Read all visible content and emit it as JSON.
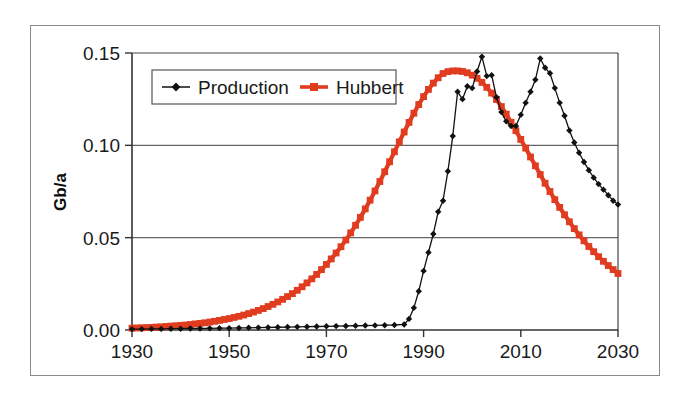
{
  "chart_data": {
    "type": "line",
    "title": "",
    "subtitle": "",
    "xlabel": "",
    "ylabel": "Gb/a",
    "xlim": [
      1930,
      2030
    ],
    "ylim": [
      0.0,
      0.15
    ],
    "xticks": [
      "1930",
      "1950",
      "1970",
      "1990",
      "2010",
      "2030"
    ],
    "xtick_values": [
      1930,
      1950,
      1970,
      1990,
      2010,
      2030
    ],
    "yticks": [
      "0.00",
      "0.05",
      "0.10",
      "0.15"
    ],
    "ytick_values": [
      0.0,
      0.05,
      0.1,
      0.15
    ],
    "grid": "horizontal",
    "legend_position": "top-left-inside",
    "colors": {
      "production": "#111111",
      "hubbert": "#e03c20",
      "axis": "#333333",
      "grid": "#666666",
      "frame": "#8a8a8a",
      "background": "#ffffff"
    },
    "series": [
      {
        "name": "Production",
        "color": "#111111",
        "marker": "diamond",
        "x": [
          1930,
          1932,
          1934,
          1936,
          1938,
          1940,
          1942,
          1944,
          1946,
          1948,
          1950,
          1952,
          1954,
          1956,
          1958,
          1960,
          1962,
          1964,
          1966,
          1968,
          1970,
          1972,
          1974,
          1976,
          1978,
          1980,
          1982,
          1984,
          1986,
          1987,
          1988,
          1989,
          1990,
          1991,
          1992,
          1993,
          1994,
          1995,
          1996,
          1997,
          1998,
          1999,
          2000,
          2001,
          2002,
          2003,
          2004,
          2005,
          2006,
          2007,
          2008,
          2009,
          2010,
          2011,
          2012,
          2013,
          2014,
          2015,
          2016,
          2017,
          2018,
          2019,
          2020,
          2021,
          2022,
          2023,
          2024,
          2025,
          2026,
          2027,
          2028,
          2029,
          2030
        ],
        "values": [
          0.0005,
          0.0005,
          0.0006,
          0.0006,
          0.0007,
          0.0007,
          0.0008,
          0.0008,
          0.0009,
          0.001,
          0.001,
          0.0011,
          0.0012,
          0.0013,
          0.0014,
          0.0015,
          0.0016,
          0.0017,
          0.0018,
          0.0019,
          0.002,
          0.0021,
          0.0022,
          0.0023,
          0.0024,
          0.0025,
          0.0026,
          0.0027,
          0.003,
          0.006,
          0.012,
          0.021,
          0.032,
          0.042,
          0.052,
          0.064,
          0.07,
          0.086,
          0.105,
          0.129,
          0.125,
          0.132,
          0.131,
          0.14,
          0.148,
          0.1375,
          0.138,
          0.126,
          0.118,
          0.113,
          0.1105,
          0.1105,
          0.1165,
          0.123,
          0.129,
          0.1355,
          0.147,
          0.142,
          0.139,
          0.131,
          0.123,
          0.116,
          0.108,
          0.1015,
          0.096,
          0.091,
          0.0865,
          0.0825,
          0.079,
          0.076,
          0.073,
          0.07,
          0.068
        ]
      },
      {
        "name": "Hubbert",
        "color": "#e03c20",
        "marker": "square",
        "x": [
          1930,
          1931,
          1932,
          1933,
          1934,
          1935,
          1936,
          1937,
          1938,
          1939,
          1940,
          1941,
          1942,
          1943,
          1944,
          1945,
          1946,
          1947,
          1948,
          1949,
          1950,
          1951,
          1952,
          1953,
          1954,
          1955,
          1956,
          1957,
          1958,
          1959,
          1960,
          1961,
          1962,
          1963,
          1964,
          1965,
          1966,
          1967,
          1968,
          1969,
          1970,
          1971,
          1972,
          1973,
          1974,
          1975,
          1976,
          1977,
          1978,
          1979,
          1980,
          1981,
          1982,
          1983,
          1984,
          1985,
          1986,
          1987,
          1988,
          1989,
          1990,
          1991,
          1992,
          1993,
          1994,
          1995,
          1996,
          1997,
          1998,
          1999,
          2000,
          2001,
          2002,
          2003,
          2004,
          2005,
          2006,
          2007,
          2008,
          2009,
          2010,
          2011,
          2012,
          2013,
          2014,
          2015,
          2016,
          2017,
          2018,
          2019,
          2020,
          2021,
          2022,
          2023,
          2024,
          2025,
          2026,
          2027,
          2028,
          2029,
          2030
        ],
        "values": [
          0.001,
          0.0011,
          0.0012,
          0.0013,
          0.0014,
          0.0016,
          0.0017,
          0.0019,
          0.0021,
          0.0023,
          0.0025,
          0.0027,
          0.003,
          0.0033,
          0.0036,
          0.0039,
          0.0043,
          0.0047,
          0.0052,
          0.0057,
          0.0062,
          0.0068,
          0.0074,
          0.0081,
          0.0089,
          0.0097,
          0.0106,
          0.0116,
          0.0127,
          0.0139,
          0.0152,
          0.0166,
          0.0181,
          0.0197,
          0.0215,
          0.0234,
          0.0255,
          0.0277,
          0.0301,
          0.0327,
          0.0355,
          0.0385,
          0.0417,
          0.0451,
          0.0487,
          0.0526,
          0.0567,
          0.061,
          0.0656,
          0.0703,
          0.0753,
          0.0804,
          0.0857,
          0.0911,
          0.0965,
          0.1019,
          0.1072,
          0.1124,
          0.1174,
          0.1221,
          0.1264,
          0.1303,
          0.1337,
          0.1366,
          0.1389,
          0.1399,
          0.1403,
          0.1403,
          0.14,
          0.1393,
          0.138,
          0.1363,
          0.1341,
          0.1314,
          0.1283,
          0.1248,
          0.121,
          0.1169,
          0.1125,
          0.1079,
          0.1032,
          0.0985,
          0.0937,
          0.0889,
          0.0842,
          0.0795,
          0.075,
          0.0706,
          0.0664,
          0.0624,
          0.0586,
          0.0549,
          0.0515,
          0.0483,
          0.0452,
          0.0424,
          0.0397,
          0.0372,
          0.0349,
          0.0327,
          0.0306
        ]
      }
    ],
    "legend": [
      {
        "label": "Production",
        "color": "#111111",
        "marker": "diamond"
      },
      {
        "label": "Hubbert",
        "color": "#e03c20",
        "marker": "square"
      }
    ]
  }
}
